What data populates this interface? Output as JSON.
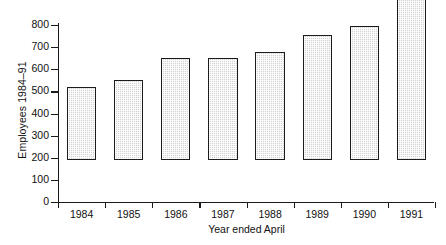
{
  "chart_data": {
    "type": "bar",
    "title": "",
    "xlabel": "Year ended April",
    "ylabel": "Employees 1984–91",
    "categories": [
      "1984",
      "1985",
      "1986",
      "1987",
      "1988",
      "1989",
      "1990",
      "1991"
    ],
    "values": [
      330,
      360,
      460,
      460,
      490,
      565,
      605,
      780
    ],
    "ylim": [
      0,
      800
    ],
    "ytick_labels": [
      "800",
      "700",
      "600",
      "500",
      "400",
      "300",
      "200",
      "100",
      "0"
    ],
    "ytick_values": [
      800,
      700,
      600,
      500,
      400,
      300,
      200,
      100,
      0
    ],
    "grid": false,
    "legend": false,
    "legend_position": "none",
    "series": [
      {
        "name": "Employees",
        "values": [
          330,
          360,
          460,
          460,
          490,
          565,
          605,
          780
        ]
      }
    ],
    "colors": {
      "bar_fill": "#d2d2d2",
      "bar_border": "#1c1c1c",
      "axis": "#1a1a1a",
      "text": "#111111",
      "background": "#ffffff"
    }
  }
}
